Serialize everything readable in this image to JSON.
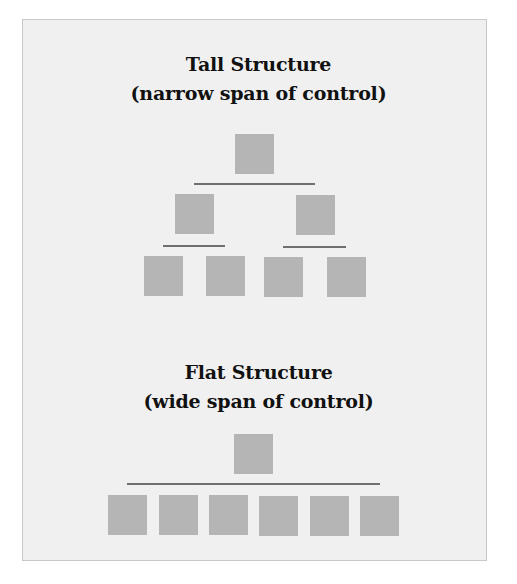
{
  "tall": {
    "title": "Tall Structure",
    "subtitle": "(narrow span of control)",
    "levels": [
      1,
      2,
      4
    ]
  },
  "flat": {
    "title": "Flat Structure",
    "subtitle": "(wide span of control)",
    "levels": [
      1,
      6
    ]
  },
  "colors": {
    "panel_bg": "#f0f0f0",
    "box": "#b5b5b5",
    "connector": "#6f6f6f",
    "text": "#111111"
  }
}
